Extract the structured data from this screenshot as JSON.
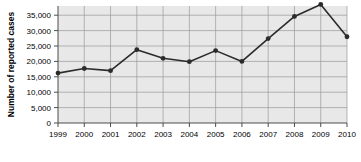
{
  "chart_data": {
    "type": "line",
    "title": "",
    "xlabel": "",
    "ylabel": "Number of reported cases",
    "categories": [
      "1999",
      "2000",
      "2001",
      "2002",
      "2003",
      "2004",
      "2005",
      "2006",
      "2007",
      "2008",
      "2009",
      "2010"
    ],
    "values": [
      16200,
      17700,
      17000,
      23800,
      21000,
      19900,
      23500,
      20000,
      27400,
      34600,
      38500,
      28000
    ],
    "ylim": [
      0,
      38500
    ],
    "ytick_labels": [
      "0",
      "5,000",
      "10,000",
      "15,000",
      "20,000",
      "25,000",
      "30,000",
      "35,000"
    ],
    "ytick_values": [
      0,
      5000,
      10000,
      15000,
      20000,
      25000,
      30000,
      35000
    ],
    "grid": true,
    "legend": "none",
    "series_color": "#2b2b2b",
    "marker": "circle",
    "plot_background": "#e8e8e8",
    "grid_color": "#9a9a9a"
  }
}
